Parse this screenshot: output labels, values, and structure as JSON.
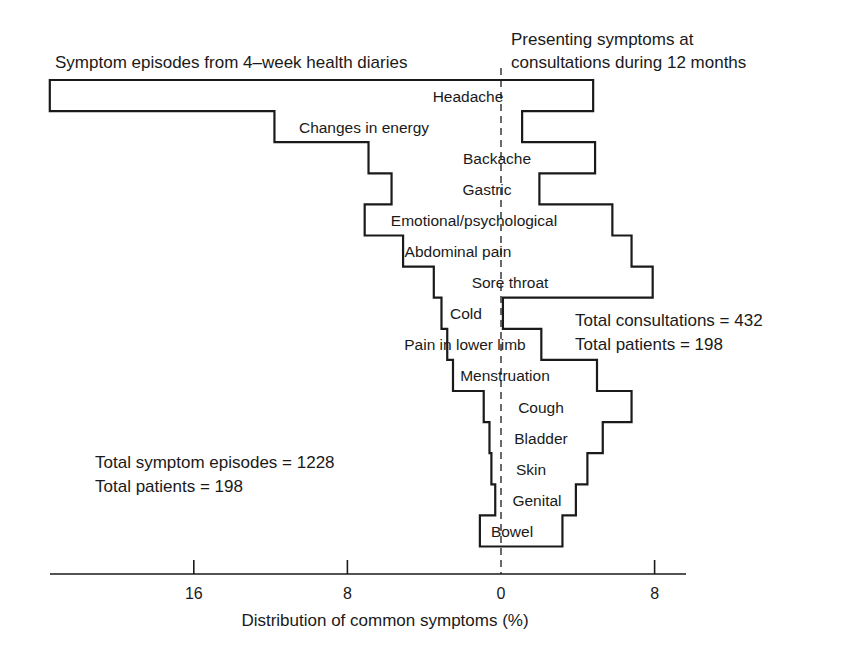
{
  "chart_data": {
    "type": "bar",
    "subtype": "back-to-back step histogram",
    "title_left": "Symptom episodes from 4–week health diaries",
    "title_right_line1": "Presenting symptoms at",
    "title_right_line2": "consultations during 12 months",
    "xlabel": "Distribution of common symptoms (%)",
    "ylabel": "",
    "x_ticks": [
      {
        "label": "16",
        "value": -16
      },
      {
        "label": "8",
        "value": -8
      },
      {
        "label": "0",
        "value": 0
      },
      {
        "label": "8",
        "value": 8
      }
    ],
    "xlim": [
      -23.5,
      9.5
    ],
    "grid": false,
    "categories": [
      "Headache",
      "Changes in energy",
      "Backache",
      "Gastric",
      "Emotional/psychological",
      "Abdominal pain",
      "Sore throat",
      "Cold",
      "Pain in lower limb",
      "Menstruation",
      "Cough",
      "Bladder",
      "Skin",
      "Genital",
      "Bowel"
    ],
    "series": [
      {
        "name": "Symptom episodes from 4-week health diaries",
        "side": "left",
        "values": [
          23.5,
          11.8,
          6.9,
          5.7,
          7.1,
          5.1,
          3.5,
          3.1,
          2.8,
          2.5,
          0.9,
          0.6,
          0.5,
          0.3,
          1.1
        ]
      },
      {
        "name": "Presenting symptoms at consultations during 12 months",
        "side": "right",
        "values": [
          4.8,
          1.1,
          4.9,
          2.0,
          5.8,
          6.8,
          7.9,
          0.1,
          2.1,
          5.0,
          6.8,
          5.3,
          4.5,
          3.9,
          3.2
        ]
      }
    ],
    "label_offsets": [
      [
        -3.3
      ],
      [
        -11.0
      ],
      [
        -2.3
      ],
      [
        -1.8
      ],
      [
        -6.6
      ],
      [
        -4.9
      ],
      [
        -2.3
      ],
      [
        -2.8
      ],
      [
        -5.7
      ],
      [
        -2.2
      ],
      [
        0.8
      ],
      [
        0.8
      ],
      [
        0.8
      ],
      [
        0.4
      ],
      [
        -0.8
      ]
    ],
    "annotations": {
      "left_total_line1": "Total symptom episodes = 1228",
      "left_total_line2": "Total patients = 198",
      "right_total_line1": "Total consultations = 432",
      "right_total_line2": "Total patients = 198"
    }
  }
}
